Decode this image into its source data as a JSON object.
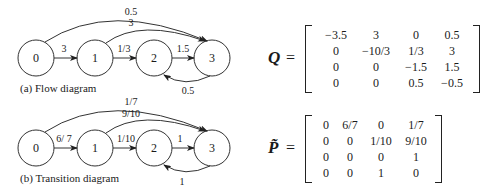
{
  "flow_diagram": {
    "caption": "(a) Flow diagram",
    "nodes": [
      "0",
      "1",
      "2",
      "3"
    ],
    "edges": [
      {
        "from": "0",
        "to": "1",
        "label": "3"
      },
      {
        "from": "1",
        "to": "2",
        "label": "1/3"
      },
      {
        "from": "2",
        "to": "3",
        "label": "1.5"
      },
      {
        "from": "3",
        "to": "2",
        "label": "0.5"
      },
      {
        "from": "0",
        "to": "3",
        "label": "0.5"
      },
      {
        "from": "1",
        "to": "3",
        "label": "3"
      }
    ]
  },
  "transition_diagram": {
    "caption": "(b) Transition diagram",
    "nodes": [
      "0",
      "1",
      "2",
      "3"
    ],
    "edges": [
      {
        "from": "0",
        "to": "1",
        "label": "6/ 7"
      },
      {
        "from": "1",
        "to": "2",
        "label": "1/10"
      },
      {
        "from": "2",
        "to": "3",
        "label": "1"
      },
      {
        "from": "3",
        "to": "2",
        "label": "1"
      },
      {
        "from": "0",
        "to": "3",
        "label": "1/7"
      },
      {
        "from": "1",
        "to": "3",
        "label": "9/10"
      }
    ]
  },
  "q_matrix": {
    "label": "Q",
    "equals": "=",
    "rows": [
      [
        "−3.5",
        "3",
        "0",
        "0.5"
      ],
      [
        "0",
        "−10/3",
        "1/3",
        "3"
      ],
      [
        "0",
        "0",
        "−1.5",
        "1.5"
      ],
      [
        "0",
        "0",
        "0.5",
        "−0.5"
      ]
    ]
  },
  "p_matrix": {
    "label": "P̃",
    "equals": "=",
    "rows": [
      [
        "0",
        "6/7",
        "0",
        "1/7"
      ],
      [
        "0",
        "0",
        "1/10",
        "9/10"
      ],
      [
        "0",
        "0",
        "0",
        "1"
      ],
      [
        "0",
        "0",
        "1",
        "0"
      ]
    ]
  }
}
